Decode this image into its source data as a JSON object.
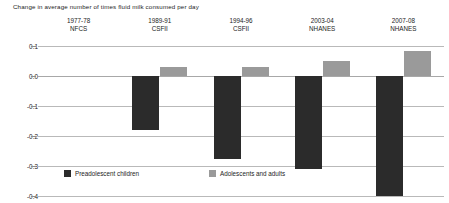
{
  "chart_data": {
    "type": "bar",
    "title": "Change in average number of times fluid milk consumed per day",
    "xlabel": "",
    "ylabel": "",
    "ylim": [
      -0.4,
      0.1
    ],
    "yticks": [
      "0.1",
      "0.0",
      "-0.1",
      "-0.2",
      "-0.3",
      "-0.4"
    ],
    "ytick_values": [
      0.1,
      0.0,
      -0.1,
      -0.2,
      -0.3,
      -0.4
    ],
    "grid": true,
    "legend_position": "bottom-left",
    "categories": [
      "1977-78 NFCS",
      "1989-91 CSFII",
      "1994-96 CSFII",
      "2003-04 NHANES",
      "2007-08 NHANES"
    ],
    "category_lines": [
      {
        "line1": "1977-78",
        "line2": "NFCS"
      },
      {
        "line1": "1989-91",
        "line2": "CSFII"
      },
      {
        "line1": "1994-96",
        "line2": "CSFII"
      },
      {
        "line1": "2003-04",
        "line2": "NHANES"
      },
      {
        "line1": "2007-08",
        "line2": "NHANES"
      }
    ],
    "series": [
      {
        "name": "Preadolescent children",
        "color": "#2b2b2b",
        "values": [
          0,
          -0.18,
          -0.275,
          -0.31,
          -0.4
        ]
      },
      {
        "name": "Adolescents and adults",
        "color": "#9a9a9a",
        "values": [
          0,
          0.03,
          0.03,
          0.05,
          0.085
        ]
      }
    ]
  },
  "legend": {
    "entries": [
      {
        "label": "Preadolescent children",
        "color": "#2b2b2b"
      },
      {
        "label": "Adolescents and adults",
        "color": "#9a9a9a"
      }
    ]
  },
  "colors": {
    "series_dark": "#2b2b2b",
    "series_gray": "#9a9a9a",
    "gridline": "#b9b9b9",
    "text": "#1c1c1c",
    "background": "#ffffff"
  }
}
